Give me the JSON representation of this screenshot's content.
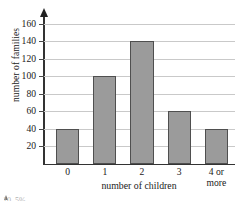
{
  "chart_data": {
    "type": "bar",
    "title": "",
    "subtitle": "",
    "categories": [
      "0",
      "1",
      "2",
      "3",
      "4 or more"
    ],
    "values": [
      40,
      100,
      140,
      60,
      40
    ],
    "xlabel": "number of children",
    "ylabel": "number of families",
    "ylim": [
      0,
      170
    ],
    "yticks": [
      20,
      40,
      60,
      80,
      100,
      120,
      140,
      160
    ],
    "ytick_labels": [
      "20",
      "40",
      "60",
      "80",
      "100",
      "120",
      "140",
      "160"
    ],
    "grid": "horizontal",
    "legend": "none",
    "bar_color": "#9b9b9b",
    "bar_edge_color": "#4f4f4f",
    "gridline_color": "#c9c9c9",
    "axis_color": "#333333",
    "background": "#ffffff",
    "y_axis_has_arrow": true,
    "annotations": []
  },
  "axes": {
    "y_title": "number of families",
    "x_title": "number of children"
  },
  "xticks": [
    {
      "line1": "0",
      "line2": ""
    },
    {
      "line1": "1",
      "line2": ""
    },
    {
      "line1": "2",
      "line2": ""
    },
    {
      "line1": "3",
      "line2": ""
    },
    {
      "line1": "4 or",
      "line2": "more"
    }
  ],
  "footer": {
    "clipped_text": "10. 5%"
  }
}
